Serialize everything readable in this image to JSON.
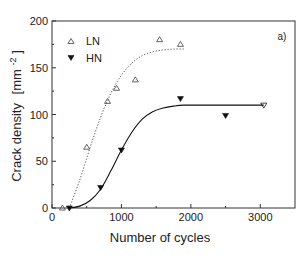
{
  "chart_data": {
    "type": "scatter",
    "title": "",
    "panel_label": "a)",
    "xlabel": "Number of cycles",
    "ylabel": "Crack density",
    "ylabel_unit": "[mm",
    "ylabel_unit_exp": "-2",
    "ylabel_unit_close": "]",
    "xlim": [
      0,
      3500
    ],
    "ylim": [
      0,
      200
    ],
    "xticks": [
      0,
      1000,
      2000,
      3000
    ],
    "xtick_labels": [
      "0",
      "1000",
      "2000",
      "3000"
    ],
    "x_minor_ticks": [
      500,
      1500,
      2500
    ],
    "yticks": [
      0,
      50,
      100,
      150,
      200
    ],
    "ytick_labels": [
      "0",
      "50",
      "100",
      "150",
      "200"
    ],
    "y_minor_ticks": [
      25,
      75,
      125,
      175
    ],
    "grid": false,
    "legend_position": "upper left",
    "series": [
      {
        "name": "LN",
        "marker": "open-triangle-up",
        "fit_line": "dotted",
        "color": "#555555",
        "x": [
          150,
          500,
          800,
          930,
          1200,
          1550,
          1850
        ],
        "y": [
          0,
          65,
          114,
          128,
          137,
          180,
          175
        ],
        "fit": {
          "x": [
            250,
            400,
            550,
            700,
            850,
            1000,
            1150,
            1300,
            1450,
            1600,
            1750,
            1900
          ],
          "y": [
            0,
            30,
            65,
            97,
            123,
            142,
            155,
            163,
            167,
            169,
            170,
            170
          ]
        }
      },
      {
        "name": "HN",
        "marker": "filled-triangle-down",
        "fit_line": "solid",
        "color": "#111111",
        "x": [
          250,
          700,
          1000,
          1850,
          2500,
          3050
        ],
        "y": [
          0,
          22,
          62,
          117,
          99,
          110
        ],
        "fit": {
          "x": [
            250,
            400,
            550,
            700,
            850,
            1000,
            1150,
            1300,
            1450,
            1600,
            1750,
            1900,
            2200,
            2600,
            3050
          ],
          "y": [
            0,
            2,
            8,
            20,
            40,
            62,
            81,
            95,
            103,
            107,
            109,
            110,
            110,
            110,
            110
          ]
        }
      }
    ]
  }
}
